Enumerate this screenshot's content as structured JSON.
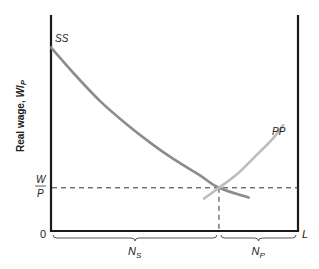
{
  "chart_data": {
    "type": "line",
    "title": "",
    "xlabel": "L",
    "ylabel": "Real wage, W/P",
    "ylabel_parts": {
      "text": "Real wage, ",
      "var_W": "W",
      "var_P": "P"
    },
    "origin_label": "0",
    "x_end_label": "L",
    "xlim": [
      0,
      1
    ],
    "ylim": [
      0,
      1
    ],
    "equilibrium": {
      "x": 0.68,
      "y": 0.2,
      "wage_label_num": "W",
      "wage_label_den": "P"
    },
    "series": [
      {
        "name": "SS",
        "label": "SS",
        "color": "#8c8c8c",
        "points": [
          [
            0,
            0.85
          ],
          [
            0.1,
            0.72
          ],
          [
            0.2,
            0.6
          ],
          [
            0.3,
            0.5
          ],
          [
            0.4,
            0.41
          ],
          [
            0.5,
            0.33
          ],
          [
            0.6,
            0.26
          ],
          [
            0.68,
            0.2
          ],
          [
            0.8,
            0.155
          ]
        ]
      },
      {
        "name": "PP",
        "label": "PP",
        "color": "#bdbdbd",
        "points": [
          [
            0.62,
            0.15
          ],
          [
            0.68,
            0.2
          ],
          [
            0.76,
            0.27
          ],
          [
            0.84,
            0.36
          ],
          [
            0.9,
            0.43
          ],
          [
            0.94,
            0.49
          ]
        ]
      }
    ],
    "braces": [
      {
        "name": "NS",
        "label_main": "N",
        "label_sub": "S",
        "from": 0,
        "to": 0.68
      },
      {
        "name": "NP",
        "label_main": "N",
        "label_sub": "P",
        "from": 0.68,
        "to": 1
      }
    ],
    "grid": false,
    "legend": "none"
  }
}
